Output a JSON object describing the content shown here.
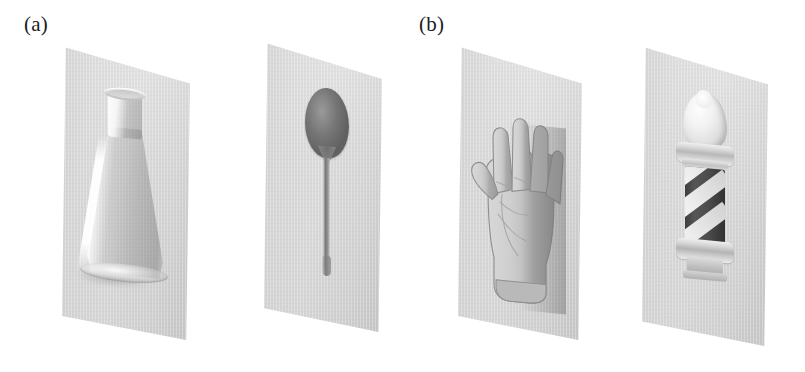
{
  "figure": {
    "width": 805,
    "height": 372,
    "background": "#ffffff"
  },
  "panels": [
    {
      "id": "a",
      "label": "(a)",
      "items": [
        {
          "name": "erlenmeyer-flask",
          "caption_text": "",
          "object": "conical laboratory flask, clear glass",
          "fill": "#dcdcdc"
        },
        {
          "name": "spoon",
          "caption_text": "",
          "object": "teaspoon seen from above, dark bowl and thin handle",
          "fill": "#6d6d6d"
        }
      ]
    },
    {
      "id": "b",
      "label": "(b)",
      "items": [
        {
          "name": "hand",
          "caption_text": "",
          "object": "open human hand, palm facing viewer, fingers spread",
          "fill": "#c9c9c9"
        },
        {
          "name": "barber-pole",
          "caption_text": "",
          "object": "barber pole with bulbous finial and diagonal white stripes",
          "fill": "#444444"
        }
      ]
    }
  ],
  "cards": {
    "sheet_color": "#dcdcdc",
    "sheet_shadow": "#bdbdbd",
    "count": 4
  },
  "ghost_text": {
    "top": "",
    "bottom": ""
  },
  "colors": {
    "label_text": "#1c1c1c",
    "page_background": "#ffffff",
    "card_light": "#e2e2e2",
    "card_dark": "#d4d4d4",
    "pole_dark": "#444444",
    "pole_stripe": "#fbfbfb",
    "spoon_bowl": "#6d6d6d"
  }
}
